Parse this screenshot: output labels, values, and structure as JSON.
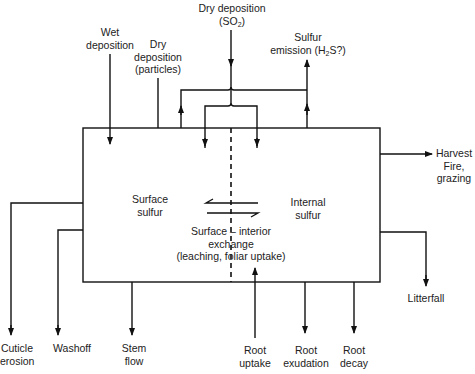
{
  "diagram": {
    "compartments": {
      "surface": [
        "Surface",
        "sulfur"
      ],
      "internal": [
        "Internal",
        "sulfur"
      ]
    },
    "exchange": [
      "Surface – interior",
      "exchange",
      "(leaching, foliar uptake)"
    ],
    "inputs": {
      "dry_so2": {
        "line1": "Dry deposition",
        "line2_pre": "(SO",
        "line2_sub": "2",
        "line2_post": ")"
      },
      "wet": [
        "Wet",
        "deposition"
      ],
      "dry_particles": [
        "Dry",
        "deposition",
        "(particles)"
      ],
      "root_uptake": [
        "Root",
        "uptake"
      ]
    },
    "outputs": {
      "emission": {
        "line1": "Sulfur",
        "line2_pre": "emission (H",
        "line2_sub": "2",
        "line2_post": "S?)"
      },
      "harvest": [
        "Harvest",
        "Fire,",
        "grazing"
      ],
      "litterfall": [
        "Litterfall"
      ],
      "cuticle": [
        "Cuticle",
        "erosion"
      ],
      "washoff": [
        "Washoff"
      ],
      "stemflow": [
        "Stem",
        "flow"
      ],
      "exudation": [
        "Root",
        "exudation"
      ],
      "decay": [
        "Root",
        "decay"
      ]
    }
  }
}
